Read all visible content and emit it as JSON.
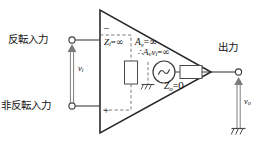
{
  "diagram": {
    "colors": {
      "line": "#3d3d3d",
      "triangle": "#2b2b2b",
      "text": "#111111",
      "dashed": "#6b6b6b",
      "background": "#ffffff"
    },
    "terminals": {
      "inverting_label": "反転入力",
      "noninverting_label": "非反転入力",
      "output_label": "出力",
      "inverting_sign": "−",
      "noninverting_sign": "+"
    },
    "voltages": {
      "input": {
        "symbol": "v",
        "subscript": "i"
      },
      "output": {
        "symbol": "v",
        "subscript": "o"
      }
    },
    "internal": {
      "input_impedance": {
        "symbol": "Z",
        "subscript": "i",
        "relation": "=",
        "value": "∞"
      },
      "open_loop_gain": {
        "symbol": "A",
        "subscript": "v",
        "relation": "=",
        "value": "∞"
      },
      "controlled_source": {
        "symbol": "A",
        "subscript": "v",
        "symbol2": "v",
        "subscript2": "i",
        "relation": "=",
        "value": "∞"
      },
      "output_impedance": {
        "symbol": "Z",
        "subscript": "o",
        "relation": "=",
        "value": "0"
      }
    },
    "symbols": {
      "ground_internal": "ground-symbol",
      "ground_output": "ground-symbol",
      "ac_source": "ac-source-symbol",
      "resistor_vertical": "resistor-symbol",
      "resistor_horizontal": "resistor-symbol"
    }
  }
}
